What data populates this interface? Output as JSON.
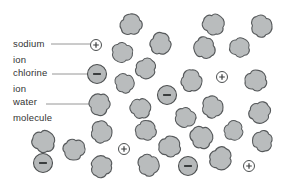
{
  "diagram": {
    "background_color": "#ffffff",
    "colors": {
      "molecule_fill": "#b9bcbd",
      "molecule_stroke": "#55585a",
      "chloride_fill": "#b6b9ba",
      "sodium_fill": "#fdfdfd",
      "ion_stroke": "#4c4f50",
      "symbol_color": "#3a3d3e",
      "leader_line": "#8a8a8a",
      "text": "#333333"
    },
    "labels": {
      "sodium": {
        "line1": "sodium",
        "line2": "ion"
      },
      "chlorine": {
        "line1": "chlorine",
        "line2": "ion"
      },
      "water": {
        "line1": "water",
        "line2": "molecule"
      }
    },
    "symbols": {
      "sodium_ion": "+",
      "chloride_ion": "−"
    },
    "leader_lines": [
      {
        "x1": 51,
        "y1": 44,
        "x2": 90,
        "y2": 44
      },
      {
        "x1": 52,
        "y1": 74,
        "x2": 87,
        "y2": 74
      },
      {
        "x1": 46,
        "y1": 104,
        "x2": 90,
        "y2": 104
      }
    ],
    "sodium_ions": [
      {
        "x": 96,
        "y": 45
      },
      {
        "x": 222,
        "y": 77
      },
      {
        "x": 124,
        "y": 149
      },
      {
        "x": 249,
        "y": 166
      }
    ],
    "chloride_ions": [
      {
        "x": 97,
        "y": 74
      },
      {
        "x": 167,
        "y": 95
      },
      {
        "x": 43,
        "y": 163
      },
      {
        "x": 188,
        "y": 166
      }
    ],
    "water_molecules": [
      {
        "x": 131,
        "y": 24,
        "rot": 355,
        "scale": 1.0
      },
      {
        "x": 214,
        "y": 24,
        "rot": 40,
        "scale": 1.0
      },
      {
        "x": 262,
        "y": 26,
        "rot": 85,
        "scale": 1.0
      },
      {
        "x": 161,
        "y": 44,
        "rot": 120,
        "scale": 1.0
      },
      {
        "x": 122,
        "y": 53,
        "rot": 205,
        "scale": 0.95
      },
      {
        "x": 204,
        "y": 48,
        "rot": 250,
        "scale": 1.0
      },
      {
        "x": 240,
        "y": 47,
        "rot": 25,
        "scale": 0.92
      },
      {
        "x": 146,
        "y": 69,
        "rot": 150,
        "scale": 0.95
      },
      {
        "x": 125,
        "y": 83,
        "rot": 70,
        "scale": 0.9
      },
      {
        "x": 192,
        "y": 81,
        "rot": 110,
        "scale": 1.0
      },
      {
        "x": 256,
        "y": 80,
        "rot": 15,
        "scale": 1.0
      },
      {
        "x": 99,
        "y": 104,
        "rot": 300,
        "scale": 1.0
      },
      {
        "x": 141,
        "y": 108,
        "rot": 45,
        "scale": 0.95
      },
      {
        "x": 213,
        "y": 107,
        "rot": 90,
        "scale": 1.0
      },
      {
        "x": 260,
        "y": 113,
        "rot": 160,
        "scale": 1.0
      },
      {
        "x": 185,
        "y": 118,
        "rot": 215,
        "scale": 0.95
      },
      {
        "x": 146,
        "y": 130,
        "rot": 10,
        "scale": 0.95
      },
      {
        "x": 202,
        "y": 137,
        "rot": 60,
        "scale": 1.05
      },
      {
        "x": 234,
        "y": 131,
        "rot": 130,
        "scale": 0.9
      },
      {
        "x": 262,
        "y": 141,
        "rot": 275,
        "scale": 0.95
      },
      {
        "x": 44,
        "y": 141,
        "rot": 35,
        "scale": 1.05
      },
      {
        "x": 102,
        "y": 132,
        "rot": 95,
        "scale": 1.0
      },
      {
        "x": 74,
        "y": 150,
        "rot": 185,
        "scale": 1.0
      },
      {
        "x": 101,
        "y": 166,
        "rot": 320,
        "scale": 1.0
      },
      {
        "x": 170,
        "y": 146,
        "rot": 20,
        "scale": 1.0
      },
      {
        "x": 149,
        "y": 165,
        "rot": 75,
        "scale": 1.0
      },
      {
        "x": 221,
        "y": 159,
        "rot": 140,
        "scale": 1.05
      }
    ]
  }
}
